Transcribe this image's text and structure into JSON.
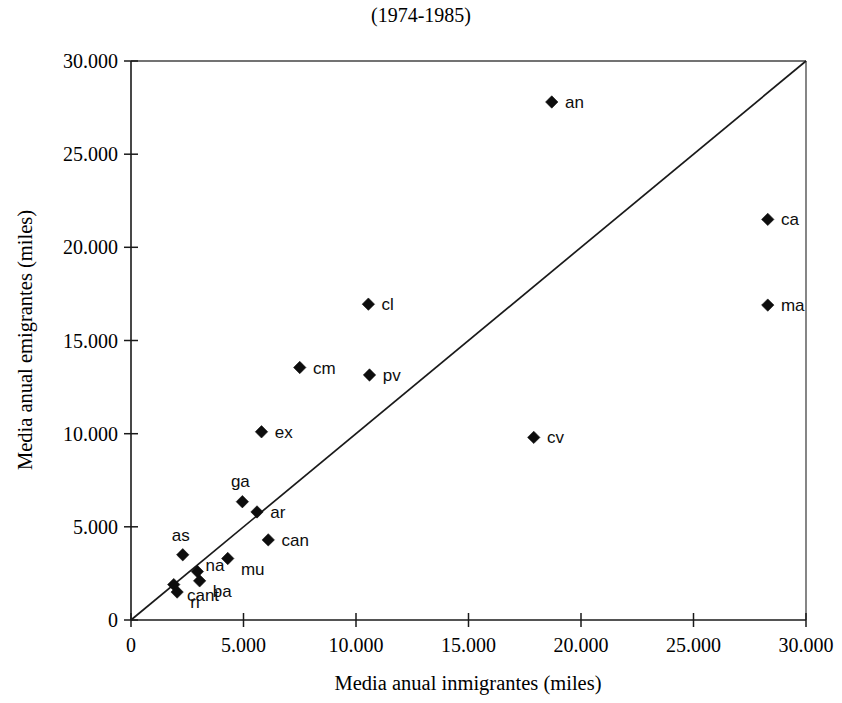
{
  "chart_data": {
    "type": "scatter",
    "title": "(1974-1985)",
    "xlabel": "Media anual inmigrantes (miles)",
    "ylabel": "Media anual emigrantes (miles)",
    "xlim": [
      0,
      30000
    ],
    "ylim": [
      0,
      30000
    ],
    "grid": false,
    "legend": "none",
    "xticks": [
      0,
      5000,
      10000,
      15000,
      20000,
      25000,
      30000
    ],
    "yticks": [
      0,
      5000,
      10000,
      15000,
      20000,
      25000,
      30000
    ],
    "xtick_labels": [
      "0",
      "5.000",
      "10.000",
      "15.000",
      "20.000",
      "25.000",
      "30.000"
    ],
    "ytick_labels": [
      "0",
      "5.000",
      "10.000",
      "15.000",
      "20.000",
      "25.000",
      "30.000"
    ],
    "reference_line": {
      "description": "45-degree identity line y = x",
      "from": [
        0,
        0
      ],
      "to": [
        30000,
        30000
      ]
    },
    "marker_style": "filled-diamond",
    "points": [
      {
        "label": "an",
        "x": 18700,
        "y": 27800,
        "label_pos": "right"
      },
      {
        "label": "ca",
        "x": 28300,
        "y": 21500,
        "label_pos": "right"
      },
      {
        "label": "ma",
        "x": 28300,
        "y": 16900,
        "label_pos": "right"
      },
      {
        "label": "cl",
        "x": 10550,
        "y": 16950,
        "label_pos": "right"
      },
      {
        "label": "cm",
        "x": 7500,
        "y": 13550,
        "label_pos": "right"
      },
      {
        "label": "pv",
        "x": 10600,
        "y": 13150,
        "label_pos": "right"
      },
      {
        "label": "ex",
        "x": 5800,
        "y": 10100,
        "label_pos": "right"
      },
      {
        "label": "cv",
        "x": 17900,
        "y": 9800,
        "label_pos": "right"
      },
      {
        "label": "ga",
        "x": 4950,
        "y": 6350,
        "label_pos": "above"
      },
      {
        "label": "ar",
        "x": 5600,
        "y": 5800,
        "label_pos": "right"
      },
      {
        "label": "can",
        "x": 6100,
        "y": 4300,
        "label_pos": "right"
      },
      {
        "label": "as",
        "x": 2300,
        "y": 3500,
        "label_pos": "above"
      },
      {
        "label": "mu",
        "x": 4300,
        "y": 3300,
        "label_pos": "right-below"
      },
      {
        "label": "na",
        "x": 2950,
        "y": 2600,
        "label_pos": "above-right"
      },
      {
        "label": "ba",
        "x": 3050,
        "y": 2100,
        "label_pos": "right-below"
      },
      {
        "label": "cant",
        "x": 1900,
        "y": 1900,
        "label_pos": "right-below"
      },
      {
        "label": "ri",
        "x": 2050,
        "y": 1500,
        "label_pos": "right-below"
      }
    ]
  },
  "colors": {
    "marker": "#0d0d0d",
    "axis": "#1a1a1a",
    "frame": "#444444",
    "background": "#ffffff"
  }
}
